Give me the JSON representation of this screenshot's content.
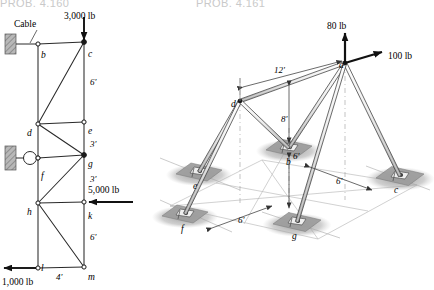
{
  "page": {
    "width": 434,
    "height": 290,
    "background": "#ffffff",
    "ink": "#1a1a1a",
    "faint_header_color": "#c9c9c9",
    "hatch_color": "#9a9a9a",
    "ground_color": "#b9b9b9"
  },
  "headers": [
    {
      "name": "prob-left",
      "text": "PROB. 4.160",
      "x": 0,
      "y": -2
    },
    {
      "name": "prob-right",
      "text": "PROB. 4.161",
      "x": 196,
      "y": -2
    }
  ],
  "figure_left": {
    "title": "Planar truss with cable support",
    "type": "2d-truss",
    "nodes": [
      {
        "id": "b",
        "label": "b",
        "x": 38,
        "y": 44,
        "lx": 41,
        "ly": 51
      },
      {
        "id": "c",
        "label": "c",
        "x": 84,
        "y": 42,
        "lx": 88,
        "ly": 50
      },
      {
        "id": "d",
        "label": "d",
        "x": 38,
        "y": 124,
        "lx": 27,
        "ly": 129
      },
      {
        "id": "e",
        "label": "e",
        "x": 84,
        "y": 122,
        "lx": 88,
        "ly": 127
      },
      {
        "id": "f",
        "label": "f",
        "x": 38,
        "y": 158,
        "lx": 41,
        "ly": 172
      },
      {
        "id": "g",
        "label": "g",
        "x": 84,
        "y": 155,
        "lx": 88,
        "ly": 160
      },
      {
        "id": "h",
        "label": "h",
        "x": 38,
        "y": 203,
        "lx": 27,
        "ly": 208
      },
      {
        "id": "k",
        "label": "k",
        "x": 84,
        "y": 202,
        "lx": 88,
        "ly": 212
      },
      {
        "id": "l",
        "label": "l",
        "x": 38,
        "y": 268,
        "lx": 41,
        "ly": 264
      },
      {
        "id": "m",
        "label": "m",
        "x": 84,
        "y": 267,
        "lx": 88,
        "ly": 273
      }
    ],
    "members": [
      {
        "from": "b",
        "to": "c"
      },
      {
        "from": "b",
        "to": "d"
      },
      {
        "from": "c",
        "to": "e"
      },
      {
        "from": "d",
        "to": "c"
      },
      {
        "from": "d",
        "to": "e"
      },
      {
        "from": "d",
        "to": "f"
      },
      {
        "from": "d",
        "to": "g"
      },
      {
        "from": "e",
        "to": "g"
      },
      {
        "from": "f",
        "to": "g"
      },
      {
        "from": "f",
        "to": "h"
      },
      {
        "from": "g",
        "to": "k"
      },
      {
        "from": "h",
        "to": "g"
      },
      {
        "from": "h",
        "to": "k"
      },
      {
        "from": "h",
        "to": "l"
      },
      {
        "from": "h",
        "to": "m"
      },
      {
        "from": "k",
        "to": "m"
      },
      {
        "from": "l",
        "to": "m"
      }
    ],
    "cable": {
      "label": "Cable",
      "label_x": 14,
      "label_y": 20,
      "leader": {
        "x1": 38,
        "y1": 31,
        "x2": 30,
        "y2": 44
      },
      "wall_to_b": {
        "x1": 16,
        "y1": 44,
        "x2": 38,
        "y2": 44
      }
    },
    "wall_top": {
      "x": 5,
      "y": 34,
      "w": 11,
      "h": 20
    },
    "wall_mid": {
      "x": 5,
      "y": 146,
      "w": 11,
      "h": 24
    },
    "pin_support": {
      "name": "pin-roller-support-f",
      "circle_cx": 29,
      "circle_cy": 158,
      "r": 6,
      "stem_x1": 16,
      "stem_y1": 158,
      "stem_x2": 23,
      "stem_y2": 158
    },
    "loads": [
      {
        "name": "load-3000lb",
        "text": "3,000 lb",
        "tx": 64,
        "ty": 12,
        "arrow": {
          "x1": 84,
          "y1": 17,
          "x2": 84,
          "y2": 40
        },
        "dir": "down"
      },
      {
        "name": "load-5000lb",
        "text": "5,000 lb",
        "tx": 88,
        "ty": 186,
        "arrow": {
          "x1": 133,
          "y1": 202,
          "x2": 89,
          "y2": 202
        },
        "dir": "left"
      },
      {
        "name": "load-1000lb",
        "text": "1,000 lb",
        "tx": 2,
        "ty": 278,
        "arrow": {
          "x1": 36,
          "y1": 268,
          "x2": 4,
          "y2": 268
        },
        "dir": "left"
      }
    ],
    "dimensions": [
      {
        "name": "dim-c-e-6ft",
        "text": "6'",
        "x": 90,
        "y": 78
      },
      {
        "name": "dim-e-g-3ft",
        "text": "3'",
        "x": 90,
        "y": 140
      },
      {
        "name": "dim-g-k-3ft",
        "text": "3'",
        "x": 90,
        "y": 175
      },
      {
        "name": "dim-k-m-6ft",
        "text": "6'",
        "x": 90,
        "y": 233
      },
      {
        "name": "dim-l-m-4ft",
        "text": "4'",
        "x": 56,
        "y": 273
      }
    ]
  },
  "figure_right": {
    "title": "Three-dimensional space frame on base plates",
    "type": "3d-space-frame",
    "nodes": [
      {
        "id": "a",
        "label": "a",
        "x": 345,
        "y": 63,
        "lx": 339,
        "ly": 61
      },
      {
        "id": "d",
        "label": "d",
        "x": 240,
        "y": 101,
        "lx": 231,
        "ly": 100
      },
      {
        "id": "b",
        "label": "b",
        "x": 289,
        "y": 148,
        "lx": 286,
        "ly": 158
      },
      {
        "id": "c",
        "label": "c",
        "x": 400,
        "y": 176,
        "lx": 394,
        "ly": 186
      },
      {
        "id": "e",
        "label": "e",
        "x": 199,
        "y": 172,
        "lx": 193,
        "ly": 182
      },
      {
        "id": "f",
        "label": "f",
        "x": 185,
        "y": 214,
        "lx": 181,
        "ly": 225
      },
      {
        "id": "g",
        "label": "g",
        "x": 297,
        "y": 222,
        "lx": 292,
        "ly": 232
      }
    ],
    "struts": [
      {
        "from": "a",
        "to": "b"
      },
      {
        "from": "a",
        "to": "c"
      },
      {
        "from": "a",
        "to": "g"
      },
      {
        "from": "a",
        "to": "d"
      },
      {
        "from": "d",
        "to": "e"
      },
      {
        "from": "d",
        "to": "f"
      },
      {
        "from": "d",
        "to": "b"
      }
    ],
    "base_plates": [
      {
        "id": "b",
        "cx": 289,
        "cy": 148,
        "w": 46,
        "h": 18
      },
      {
        "id": "c",
        "cx": 400,
        "cy": 176,
        "w": 48,
        "h": 19
      },
      {
        "id": "e",
        "cx": 199,
        "cy": 172,
        "w": 46,
        "h": 18
      },
      {
        "id": "f",
        "cx": 185,
        "cy": 214,
        "w": 46,
        "h": 18
      },
      {
        "id": "g",
        "cx": 297,
        "cy": 222,
        "w": 48,
        "h": 19
      }
    ],
    "loads": [
      {
        "name": "load-80lb",
        "text": "80 lb",
        "tx": 327,
        "ty": 22,
        "arrow": {
          "x1": 345,
          "y1": 63,
          "x2": 345,
          "y2": 33
        },
        "dir": "up"
      },
      {
        "name": "load-100lb",
        "text": "100 lb",
        "tx": 388,
        "ty": 52,
        "arrow": {
          "x1": 345,
          "y1": 63,
          "x2": 382,
          "y2": 52
        },
        "dir": "right-up"
      }
    ],
    "dimensions": [
      {
        "name": "dim-d-a-12ft",
        "text": "12'",
        "x": 274,
        "y": 66
      },
      {
        "name": "dim-a-b-8ft",
        "text": "8'",
        "x": 281,
        "y": 115
      },
      {
        "name": "dim-6ft-upper",
        "text": "6'",
        "x": 293,
        "y": 152
      },
      {
        "name": "dim-6ft-right",
        "text": "6'",
        "x": 336,
        "y": 177
      },
      {
        "name": "dim-6ft-lower",
        "text": "6'",
        "x": 238,
        "y": 216
      }
    ]
  }
}
